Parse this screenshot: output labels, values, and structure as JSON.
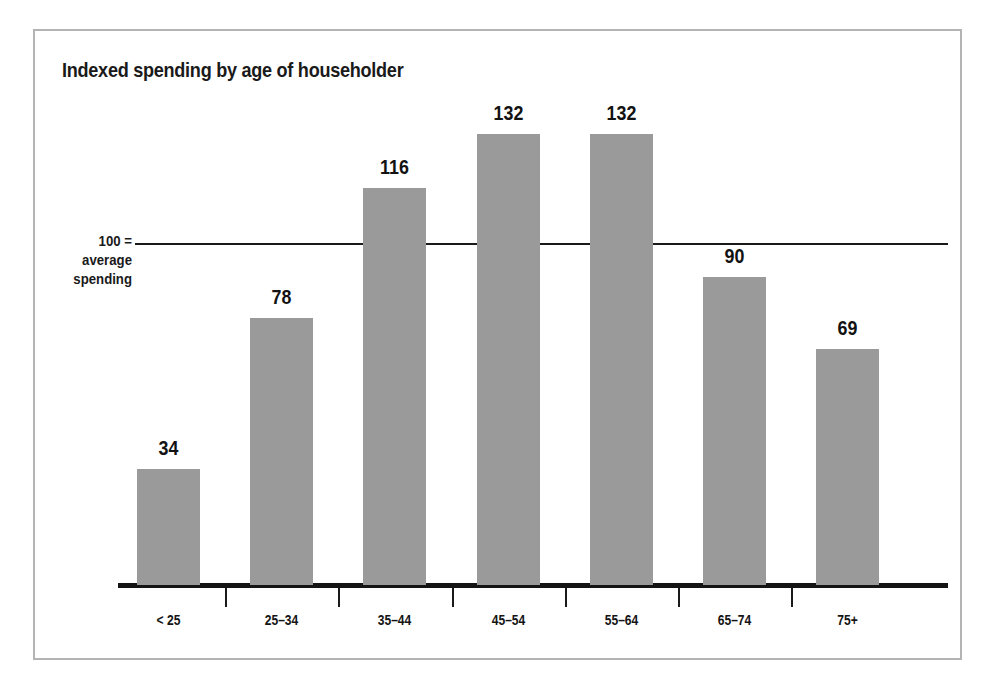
{
  "figure": {
    "background_color": "#ffffff",
    "frame_color": "#b4b4b4"
  },
  "chart_data": {
    "type": "bar",
    "title": "Indexed spending by age of householder",
    "subtitle": "",
    "xlabel": "",
    "ylabel": "",
    "categories": [
      "< 25",
      "25–34",
      "35–44",
      "45–54",
      "55–64",
      "65–74",
      "75+"
    ],
    "values": [
      34,
      78,
      116,
      132,
      132,
      90,
      69
    ],
    "data_labels": [
      "34",
      "78",
      "116",
      "132",
      "132",
      "90",
      "69"
    ],
    "ylim": [
      0,
      160
    ],
    "grid": false,
    "legend": null,
    "bar_color": "#9a9a9a",
    "reference_line": {
      "value": 100,
      "label_lines": [
        "100 =",
        "average",
        "spending"
      ],
      "color": "#1a1a1a"
    },
    "axis": {
      "baseline_color": "#141414",
      "tick_placement": "between-categories"
    }
  }
}
